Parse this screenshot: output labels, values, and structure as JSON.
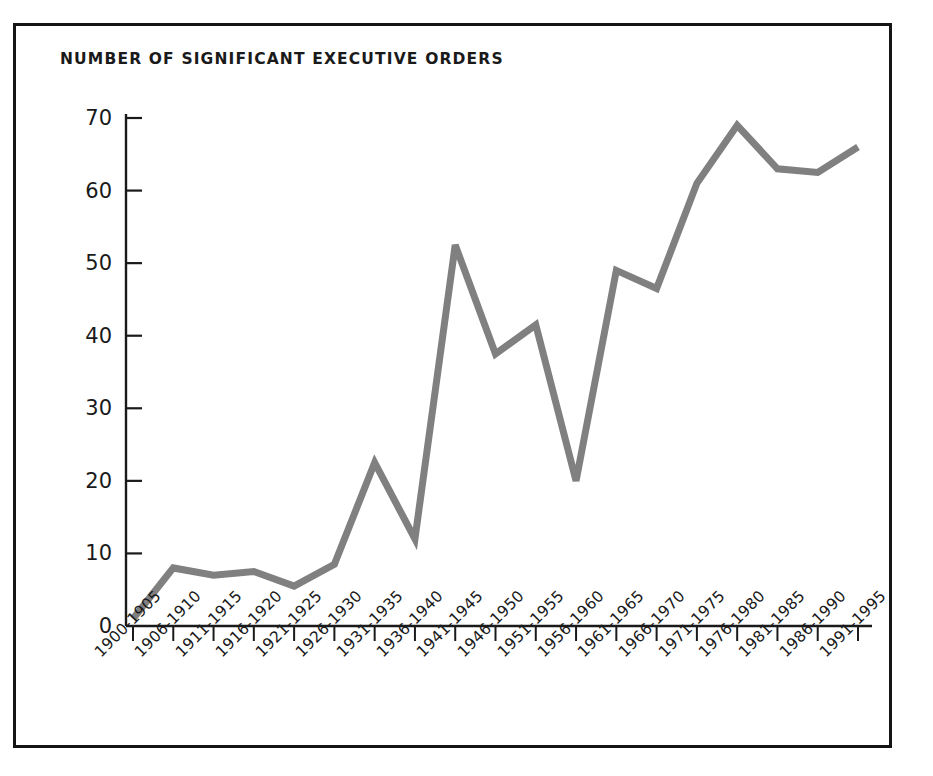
{
  "chart_data": {
    "type": "line",
    "title": "NUMBER OF SIGNIFICANT EXECUTIVE ORDERS",
    "xlabel": "",
    "ylabel": "",
    "categories": [
      "1900-1905",
      "1906-1910",
      "1911-1915",
      "1916-1920",
      "1921-1925",
      "1926-1930",
      "1931-1935",
      "1936-1940",
      "1941-1945",
      "1946-1950",
      "1951-1955",
      "1956-1960",
      "1961-1965",
      "1966-1970",
      "1971-1975",
      "1976-1980",
      "1981-1985",
      "1986-1990",
      "1991-1995"
    ],
    "values": [
      1,
      8,
      7,
      7.5,
      5.5,
      8.5,
      22.5,
      12,
      52.5,
      37.5,
      41.5,
      20,
      49,
      46.5,
      61,
      69,
      63,
      62.5,
      66
    ],
    "ylim": [
      0,
      70
    ],
    "yticks": [
      0,
      10,
      20,
      30,
      40,
      50,
      60,
      70
    ],
    "ytick_labels": [
      "0",
      "10",
      "20",
      "30",
      "40",
      "50",
      "60",
      "70"
    ],
    "grid": false,
    "legend": null,
    "line_color": "#808080",
    "axis_color": "#1a1a1a",
    "background_color": "#ffffff"
  },
  "frame": {
    "border_color": "#151515"
  }
}
